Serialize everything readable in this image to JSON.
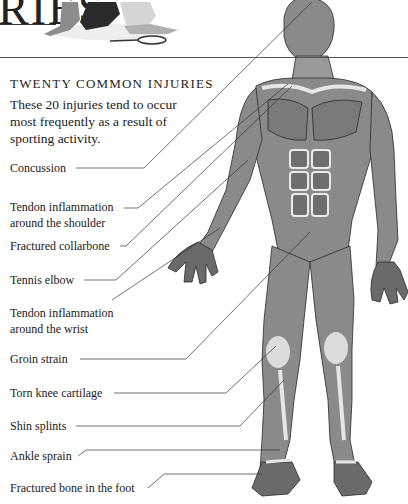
{
  "header": {
    "title_fragment": "RIES",
    "photo": "sitting-tennis-players-photo"
  },
  "section": {
    "heading": "TWENTY COMMON INJURIES",
    "intro": "These 20 injuries tend to occur most frequently as a result of sporting activity."
  },
  "labels": [
    {
      "line1": "Concussion",
      "line2": ""
    },
    {
      "line1": "Tendon inflammation",
      "line2": "around the shoulder"
    },
    {
      "line1": "Fractured collarbone",
      "line2": ""
    },
    {
      "line1": "Tennis elbow",
      "line2": ""
    },
    {
      "line1": "Tendon inflammation",
      "line2": "around the wrist"
    },
    {
      "line1": "Groin strain",
      "line2": ""
    },
    {
      "line1": "Torn knee cartilage",
      "line2": ""
    },
    {
      "line1": "Shin splints",
      "line2": ""
    },
    {
      "line1": "Ankle sprain",
      "line2": ""
    },
    {
      "line1": "Fractured bone in the foot",
      "line2": ""
    }
  ],
  "figure": {
    "colors": {
      "muscle": "#8a8a8a",
      "muscle_dark": "#5e5e5e",
      "tendon": "#e2e2e2",
      "outline": "#2a2a2a"
    }
  }
}
